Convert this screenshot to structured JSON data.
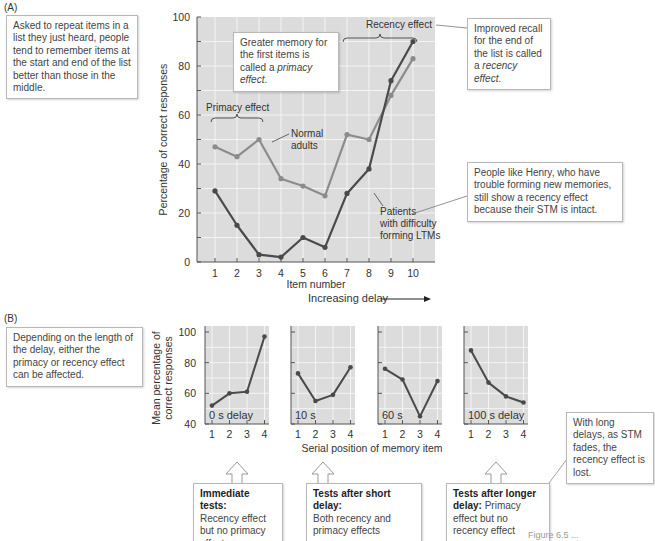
{
  "panel_a": {
    "label": "(A)",
    "left_note": "Asked to repeat items in a list they just heard, people tend to remember items at the start and end of the list better than those in the middle.",
    "primacy_note_pre": "Greater memory for the first items is called a ",
    "primacy_note_em": "primacy effect",
    "primacy_note_post": ".",
    "recency_note_pre": "Improved recall for the end of the list is called a ",
    "recency_note_em": "recency effect",
    "recency_note_post": ".",
    "henry_note": "People like Henry, who have trouble forming new memories, still show a recency effect because their STM is intact.",
    "primacy_bracket_label": "Primacy effect",
    "recency_bracket_label": "Recency effect",
    "normal_label_1": "Normal",
    "normal_label_2": "adults",
    "patients_label_1": "Patients",
    "patients_label_2": "with difficulty",
    "patients_label_3": "forming LTMs"
  },
  "panel_b": {
    "label": "(B)",
    "left_note": "Depending on the length of the delay, either the primacy or recency effect can be affected.",
    "increasing_delay": "Increasing delay",
    "long_delay_note": "With long delays, as STM fades, the recency effect is lost.",
    "callouts": [
      {
        "bold": "Immediate tests:",
        "text": "Recency effect but no primacy effect"
      },
      {
        "bold": "Tests after short delay:",
        "text": "Both recency and primacy effects"
      },
      {
        "bold": "Tests after longer delay:",
        "text": "Primacy effect but no recency effect"
      }
    ]
  },
  "caption_fragment": "Figure 6.5 ...",
  "colors": {
    "plot_bg": "#dcdcdc",
    "grid": "#f4f4f4",
    "normal_line": "#8c8c8c",
    "patients_line": "#4a4a4a",
    "axis": "#555555"
  },
  "chart_data": [
    {
      "type": "line",
      "title": "Serial position curve",
      "xlabel": "Item number",
      "ylabel": "Percentage of correct responses",
      "x": [
        1,
        2,
        3,
        4,
        5,
        6,
        7,
        8,
        9,
        10
      ],
      "series": [
        {
          "name": "Normal adults",
          "values": [
            47,
            43,
            50,
            34,
            31,
            27,
            52,
            50,
            68,
            83
          ]
        },
        {
          "name": "Patients with difficulty forming LTMs",
          "values": [
            29,
            15,
            3,
            2,
            10,
            6,
            28,
            38,
            74,
            90
          ]
        }
      ],
      "ylim": [
        0,
        100
      ],
      "yticks": [
        0,
        20,
        40,
        60,
        80,
        100
      ],
      "grid": true,
      "annotations": [
        "Primacy effect (items 1-3)",
        "Recency effect (items 7-10)"
      ]
    },
    {
      "type": "line",
      "title": "0 s delay",
      "xlabel": "Serial position of memory item",
      "ylabel": "Mean percentage of correct responses",
      "x": [
        1,
        2,
        3,
        4
      ],
      "values": [
        52,
        60,
        61,
        97
      ],
      "ylim": [
        40,
        100
      ],
      "yticks": [
        40,
        60,
        80,
        100
      ]
    },
    {
      "type": "line",
      "title": "10 s",
      "xlabel": "Serial position of memory item",
      "x": [
        1,
        2,
        3,
        4
      ],
      "values": [
        73,
        55,
        59,
        77
      ],
      "ylim": [
        40,
        100
      ]
    },
    {
      "type": "line",
      "title": "60 s",
      "xlabel": "Serial position of memory item",
      "x": [
        1,
        2,
        3,
        4
      ],
      "values": [
        76,
        69,
        45,
        68
      ],
      "ylim": [
        40,
        100
      ]
    },
    {
      "type": "line",
      "title": "100 s delay",
      "xlabel": "Serial position of memory item",
      "x": [
        1,
        2,
        3,
        4
      ],
      "values": [
        88,
        67,
        58,
        54
      ],
      "ylim": [
        40,
        100
      ]
    }
  ]
}
